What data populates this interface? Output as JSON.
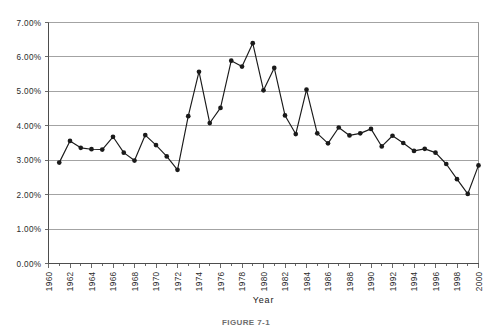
{
  "chart_data": {
    "type": "line",
    "title": "",
    "xlabel": "Year",
    "ylabel": "",
    "ylim": [
      0,
      0.07
    ],
    "xlim": [
      1960,
      2000
    ],
    "grid": true,
    "legend": null,
    "y_tick_labels": [
      "0.00%",
      "1.00%",
      "2.00%",
      "3.00%",
      "4.00%",
      "5.00%",
      "6.00%",
      "7.00%"
    ],
    "y_tick_values": [
      0.0,
      0.01,
      0.02,
      0.03,
      0.04,
      0.05,
      0.06,
      0.07
    ],
    "x_tick_labels": [
      "1960",
      "1962",
      "1964",
      "1966",
      "1968",
      "1970",
      "1972",
      "1974",
      "1976",
      "1978",
      "1980",
      "1982",
      "1984",
      "1986",
      "1988",
      "1990",
      "1992",
      "1994",
      "1996",
      "1998",
      "2000"
    ],
    "x_tick_values": [
      1960,
      1962,
      1964,
      1966,
      1968,
      1970,
      1972,
      1974,
      1976,
      1978,
      1980,
      1982,
      1984,
      1986,
      1988,
      1990,
      1992,
      1994,
      1996,
      1998,
      2000
    ],
    "x": [
      1961,
      1962,
      1963,
      1964,
      1965,
      1966,
      1967,
      1968,
      1969,
      1970,
      1971,
      1972,
      1973,
      1974,
      1975,
      1976,
      1977,
      1978,
      1979,
      1980,
      1981,
      1982,
      1983,
      1984,
      1985,
      1986,
      1987,
      1988,
      1989,
      1990,
      1991,
      1992,
      1993,
      1994,
      1995,
      1996,
      1997,
      1998,
      1999,
      2000
    ],
    "values": [
      2.93,
      3.56,
      3.36,
      3.32,
      3.31,
      3.68,
      3.22,
      2.99,
      3.73,
      3.44,
      3.11,
      2.72,
      4.28,
      5.57,
      4.08,
      4.52,
      5.89,
      5.72,
      6.4,
      5.03,
      5.68,
      4.3,
      3.76,
      5.05,
      3.78,
      3.49,
      3.95,
      3.72,
      3.78,
      3.91,
      3.4,
      3.71,
      3.5,
      3.27,
      3.33,
      3.22,
      2.89,
      2.45,
      2.02,
      2.85
    ],
    "series_name": "Rate",
    "marker": "filled-circle",
    "line_color": "#1a1a1a"
  },
  "caption": {
    "text": "FIGURE 7-1"
  }
}
